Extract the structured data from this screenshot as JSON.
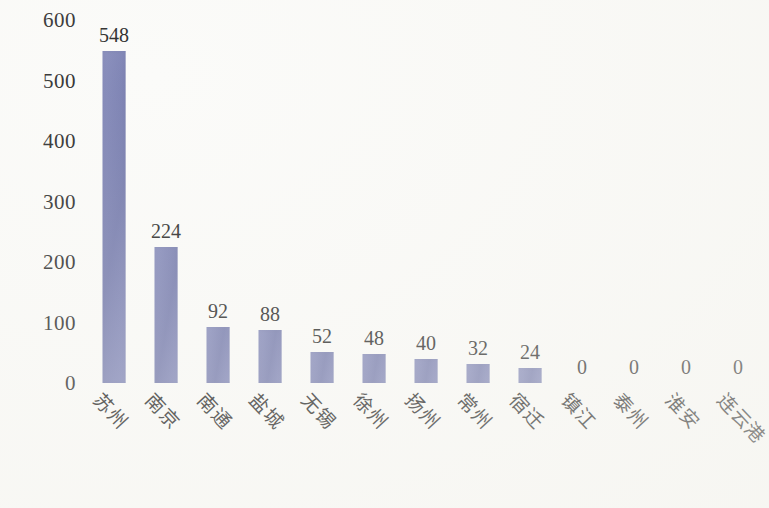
{
  "chart_data": {
    "type": "bar",
    "title": "",
    "subtitle": "",
    "xlabel": "",
    "ylabel": "",
    "categories": [
      "苏州",
      "南京",
      "南通",
      "盐城",
      "无锡",
      "徐州",
      "扬州",
      "常州",
      "宿迁",
      "镇江",
      "泰州",
      "淮安",
      "连云港"
    ],
    "values": [
      548,
      224,
      92,
      88,
      52,
      48,
      40,
      32,
      24,
      0,
      0,
      0,
      0
    ],
    "value_labels": [
      "548",
      "224",
      "92",
      "88",
      "52",
      "48",
      "40",
      "32",
      "24",
      "0",
      "0",
      "0",
      "0"
    ],
    "ylim": [
      0,
      600
    ],
    "yticks": [
      0,
      100,
      200,
      300,
      400,
      500,
      600
    ],
    "ytick_labels": [
      "0",
      "100",
      "200",
      "300",
      "400",
      "500",
      "600"
    ],
    "grid": false,
    "axis_lines": false,
    "legend": null,
    "legend_position": "none",
    "data_labels_shown": true,
    "category_label_rotation_deg": 45,
    "bar_color": "#7b81b5",
    "text_color": "#2b2b2b",
    "background_color": "#fbfbf9"
  }
}
